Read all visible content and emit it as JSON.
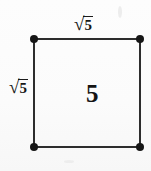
{
  "figure": {
    "type": "geometry-diagram",
    "shape": "square",
    "labels": {
      "top_side": {
        "radical_sign": "√",
        "radicand": "5",
        "text": "√5"
      },
      "left_side": {
        "radical_sign": "√",
        "radicand": "5",
        "text": "√5"
      },
      "center": "5"
    },
    "corner_dots": 4
  },
  "colors": {
    "background": "#fbfbfb",
    "line": "#2d2d2d",
    "dot": "#161616",
    "text": "#141414"
  }
}
